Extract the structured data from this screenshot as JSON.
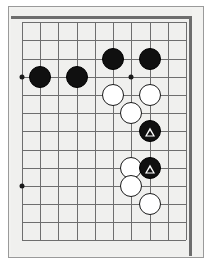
{
  "figure": {
    "kind": "go-board-diagram",
    "board_note": "partial board view, upper-left corner region"
  },
  "colors": {
    "paper": "#ffffff",
    "board": "#f0f0ee",
    "frame": "#9a9a9a",
    "gridline": "#6e6e6e",
    "board_edge": "#6d6d6d",
    "black_stone": "#101010",
    "white_stone": "#ffffff",
    "stone_outline": "#1a1a1a",
    "marker": "#ffffff"
  },
  "grid": {
    "origin_x": 22,
    "origin_y": 22,
    "spacing": 18.2,
    "columns": 10,
    "rows": 13,
    "vertical_lines": [
      22,
      40,
      58,
      77,
      95,
      113,
      131,
      150,
      168,
      186
    ],
    "horizontal_lines": [
      22,
      40,
      59,
      77,
      95,
      113,
      131,
      150,
      168,
      186,
      204,
      222,
      240
    ]
  },
  "star_points": [
    {
      "name": "hoshi-left-upper",
      "x": 22,
      "y": 77
    },
    {
      "name": "hoshi-left-lower",
      "x": 22,
      "y": 186
    },
    {
      "name": "hoshi-center-upper",
      "x": 131,
      "y": 77
    }
  ],
  "stones": [
    {
      "id": "b1",
      "color": "black",
      "x": 40,
      "y": 77,
      "radius": 11,
      "marker": "none"
    },
    {
      "id": "b2",
      "color": "black",
      "x": 77,
      "y": 77,
      "radius": 11,
      "marker": "none"
    },
    {
      "id": "b3",
      "color": "black",
      "x": 113,
      "y": 59,
      "radius": 11,
      "marker": "none"
    },
    {
      "id": "b4",
      "color": "black",
      "x": 150,
      "y": 59,
      "radius": 11,
      "marker": "none"
    },
    {
      "id": "w1",
      "color": "white",
      "x": 113,
      "y": 95,
      "radius": 11,
      "marker": "none"
    },
    {
      "id": "w2",
      "color": "white",
      "x": 150,
      "y": 95,
      "radius": 11,
      "marker": "none"
    },
    {
      "id": "w3",
      "color": "white",
      "x": 131,
      "y": 113,
      "radius": 11,
      "marker": "none"
    },
    {
      "id": "b5",
      "color": "black",
      "x": 150,
      "y": 131,
      "radius": 11,
      "marker": "triangle"
    },
    {
      "id": "w4",
      "color": "white",
      "x": 131,
      "y": 168,
      "radius": 11,
      "marker": "none"
    },
    {
      "id": "b6",
      "color": "black",
      "x": 150,
      "y": 168,
      "radius": 11,
      "marker": "triangle"
    },
    {
      "id": "w5",
      "color": "white",
      "x": 131,
      "y": 186,
      "radius": 11,
      "marker": "none"
    },
    {
      "id": "w6",
      "color": "white",
      "x": 150,
      "y": 204,
      "radius": 11,
      "marker": "none"
    }
  ],
  "markers": {
    "triangle_label": "triangle-marker",
    "triangle_count": 2
  }
}
